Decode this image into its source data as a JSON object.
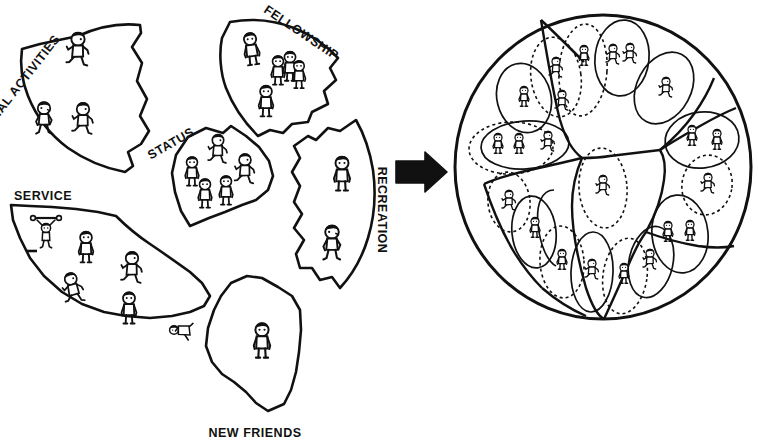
{
  "diagram": {
    "style": "hand-drawn black ink line art on white",
    "colors": {
      "ink": "#111111",
      "background": "#ffffff",
      "arrow": "#111111"
    },
    "left_cluster": {
      "name": "exploded-pie-wedges",
      "description": "Five separated pie-slice shaped pieces plus one bottom piece, each containing cartoon figures",
      "wedges": [
        {
          "id": "special-activities",
          "label": "SPECIAL ACTIVITIES",
          "label_rotation_deg": -52,
          "figure_count": 3
        },
        {
          "id": "fellowship",
          "label": "FELLOWSHIP",
          "label_rotation_deg": 34,
          "figure_count": 5
        },
        {
          "id": "status",
          "label": "STATUS",
          "label_rotation_deg": -30,
          "figure_count": 5
        },
        {
          "id": "recreation",
          "label": "RECREATION",
          "label_rotation_deg": 90,
          "figure_count": 2
        },
        {
          "id": "service",
          "label": "SERVICE",
          "label_rotation_deg": 0,
          "figure_count": 6
        },
        {
          "id": "new-friends",
          "label": "NEW FRIENDS",
          "label_rotation_deg": 0,
          "figure_count": 1
        }
      ]
    },
    "arrow": {
      "id": "transformation-arrow",
      "direction": "right",
      "label": ""
    },
    "right_cluster": {
      "name": "assembled-whole-circle",
      "description": "Complete circle divided into segments, with figures enclosed in dashed and solid ovals that cross segment boundaries",
      "segment_count": 7,
      "group_oval_count": 16,
      "figure_count": 22
    }
  }
}
